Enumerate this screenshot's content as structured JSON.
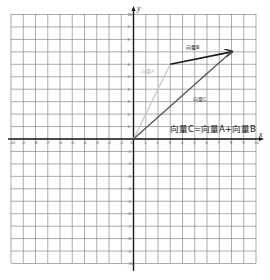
{
  "diagram": {
    "title": "向量C=向量A+向量B",
    "axes": {
      "x_label": "x",
      "y_label": "y",
      "x_range": [
        -10,
        10
      ],
      "y_range": [
        -10,
        10
      ],
      "x_ticks": [
        "-10",
        "-9",
        "-8",
        "-7",
        "-6",
        "-5",
        "-4",
        "-3",
        "-2",
        "-1",
        "0",
        "1",
        "2",
        "3",
        "4",
        "5",
        "6",
        "7",
        "8",
        "9",
        "10"
      ],
      "y_ticks": [
        "10",
        "9",
        "8",
        "7",
        "6",
        "5",
        "4",
        "3",
        "2",
        "1",
        "-1",
        "-2",
        "-3",
        "-4",
        "-5",
        "-6",
        "-7",
        "-8",
        "-9",
        "-10"
      ]
    },
    "vectors": [
      {
        "name": "向量A",
        "from": [
          0,
          0
        ],
        "to": [
          3,
          6
        ],
        "color": "#c8c8c8"
      },
      {
        "name": "向量B",
        "from": [
          3,
          6
        ],
        "to": [
          8,
          7
        ],
        "color": "#1a1a1a"
      },
      {
        "name": "向量C",
        "from": [
          0,
          0
        ],
        "to": [
          8,
          7
        ],
        "color": "#555555"
      }
    ],
    "equation": "向量C=向量A+向量B",
    "colors": {
      "grid": "#888888",
      "axis": "#1a1a1a",
      "background": "#ffffff"
    }
  }
}
